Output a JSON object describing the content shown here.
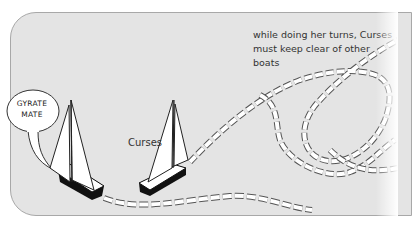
{
  "diagram": {
    "caption_line1": "while doing her turns, Curses",
    "caption_line2": "must keep clear of other boats",
    "boat_label": "Curses",
    "speech_bubble_line1": "GYRATE",
    "speech_bubble_line2": "MATE",
    "colors": {
      "background_panel": "#e4e4e4",
      "panel_border": "#a8a8a8",
      "hull": "#111111",
      "sail": "#ffffff",
      "track_stroke": "#555555"
    }
  }
}
